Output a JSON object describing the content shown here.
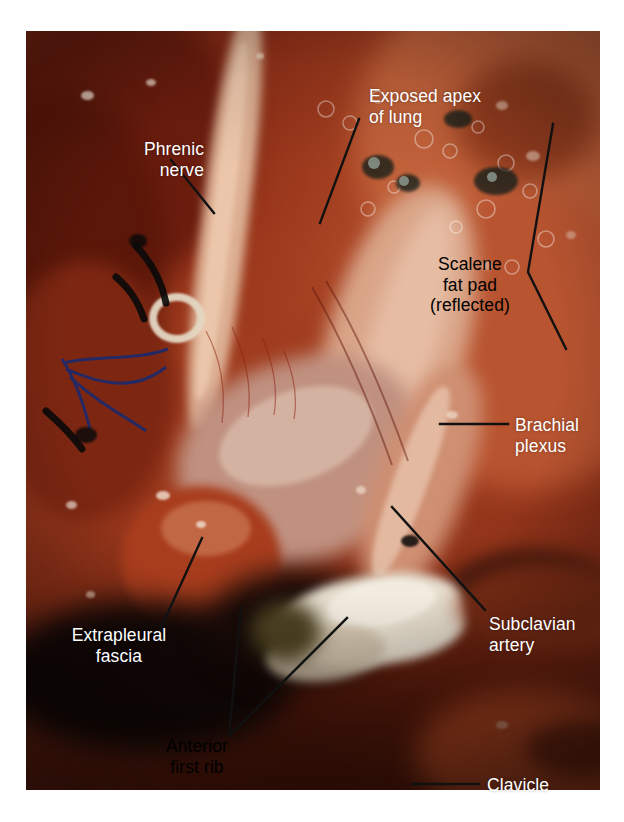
{
  "figure": {
    "kind": "surgical-anatomy-photograph",
    "plate": {
      "x": 26,
      "y": 31,
      "width": 574,
      "height": 759,
      "background_color": "#ffffff",
      "border_color": "#ffffff"
    }
  },
  "palette": {
    "background": "#ffffff",
    "label_white": "#ffffff",
    "label_black": "#000000",
    "leader_line": "#111111",
    "tissue_deep_red": "#6d1f10",
    "tissue_mid_red": "#9c3a1c",
    "tissue_bright_red": "#b8452a",
    "tissue_orange": "#c86a3c",
    "tissue_pink": "#d79a86",
    "tissue_pale": "#e3bfa8",
    "fat_pad_tan": "#d9ab8c",
    "bone_white": "#ece4d8",
    "shadow_black": "#0b0606",
    "suture_blue": "#1d2a6b",
    "vessel_loop": "#e8ddcd"
  },
  "labels": [
    {
      "id": "phrenic-nerve",
      "text": "Phrenic\nnerve",
      "color": "white",
      "align": "ta-right",
      "x": 86,
      "y": 139,
      "width": 118,
      "leader": {
        "type": "line",
        "points": [
          [
            171,
            160
          ],
          [
            214,
            213
          ]
        ]
      }
    },
    {
      "id": "exposed-apex-of-lung",
      "text": "Exposed apex\nof lung",
      "color": "white",
      "align": "ta-left",
      "x": 369,
      "y": 86,
      "width": 160,
      "leader": {
        "type": "line",
        "points": [
          [
            359,
            119
          ],
          [
            320,
            223
          ]
        ]
      }
    },
    {
      "id": "scalene-fat-pad",
      "text": "Scalene\nfat pad\n(reflected)",
      "color": "black",
      "align": "ta-center",
      "x": 404,
      "y": 254,
      "width": 132,
      "leader": {
        "type": "polyline",
        "points": [
          [
            553,
            124
          ],
          [
            528,
            272
          ],
          [
            566,
            349
          ]
        ]
      }
    },
    {
      "id": "brachial-plexus",
      "text": "Brachial\nplexus",
      "color": "white",
      "align": "ta-left",
      "x": 515,
      "y": 415,
      "width": 108,
      "leader": {
        "type": "line",
        "points": [
          [
            440,
            424
          ],
          [
            508,
            424
          ]
        ]
      }
    },
    {
      "id": "subclavian-artery",
      "text": "Subclavian\nartery",
      "color": "white",
      "align": "ta-left",
      "x": 489,
      "y": 614,
      "width": 122,
      "leader": {
        "type": "line",
        "points": [
          [
            392,
            507
          ],
          [
            485,
            610
          ]
        ]
      }
    },
    {
      "id": "extrapleural-fascia",
      "text": "Extrapleural\nfascia",
      "color": "white",
      "align": "ta-center",
      "x": 44,
      "y": 625,
      "width": 150,
      "leader": {
        "type": "line",
        "points": [
          [
            202,
            538
          ],
          [
            160,
            630
          ]
        ]
      }
    },
    {
      "id": "anterior-first-rib",
      "text": "Anterior\nfirst rib",
      "color": "black",
      "align": "ta-center",
      "x": 134,
      "y": 736,
      "width": 126,
      "leader": {
        "type": "multi",
        "points": [
          [
            [
              229,
              736
            ],
            [
              241,
              607
            ]
          ],
          [
            [
              229,
              736
            ],
            [
              347,
              618
            ]
          ]
        ]
      }
    },
    {
      "id": "clavicle",
      "text": "Clavicle",
      "color": "white",
      "align": "ta-left",
      "x": 487,
      "y": 775,
      "width": 100,
      "leader": {
        "type": "line",
        "points": [
          [
            412,
            784
          ],
          [
            479,
            784
          ]
        ]
      }
    }
  ],
  "anatomy_notes": {
    "phrenic_nerve": "Pale cord running obliquely over the anterior scalene muscle, secured with vessel loop and sutures",
    "exposed_apex_of_lung": "Glistening visceral pleura at the upper field",
    "scalene_fat_pad": "Tan fatty tissue reflected laterally, upper right",
    "brachial_plexus": "Cords emerging between scalene muscles, right of center",
    "subclavian_artery": "Vessel coursing toward the lower right beneath the plexus",
    "extrapleural_fascia": "Smooth glistening layer at lower left over the dome",
    "anterior_first_rib": "White bone surface at the lower center of the field",
    "clavicle": "Bone bounding the inferior aspect of the exposure"
  }
}
